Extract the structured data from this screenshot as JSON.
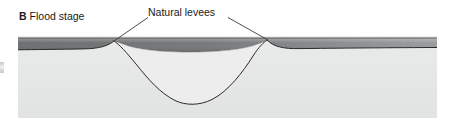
{
  "figure": {
    "panel_letter": "B",
    "panel_title": "Flood stage",
    "annotation_label": "Natural levees",
    "colors": {
      "floodplain_fill": "#e6e7e7",
      "floodplain_top_light": "#f2f2f2",
      "water_dark": "#6f7173",
      "water_light": "#b9bbbd",
      "outline": "#2b2b2b",
      "leader_line": "#3a3a3a",
      "text": "#1a1a1a",
      "background": "#ffffff"
    },
    "geometry": {
      "block_left": 18,
      "block_right": 437,
      "block_top": 38,
      "block_bottom": 118,
      "water_surface_y": 38,
      "left_levee_crest_x": 113,
      "right_levee_crest_x": 267,
      "levee_crest_y": 40,
      "channel_bottom_y": 103,
      "channel_bottom_x": 190,
      "flood_layer_top_y": 42,
      "flood_layer_bottom_y": 50
    },
    "leader_lines": [
      {
        "name": "left-leader",
        "x1": 148,
        "y1": 17,
        "x2": 114,
        "y2": 41
      },
      {
        "name": "right-leader",
        "x1": 228,
        "y1": 17,
        "x2": 268,
        "y2": 40
      }
    ]
  }
}
